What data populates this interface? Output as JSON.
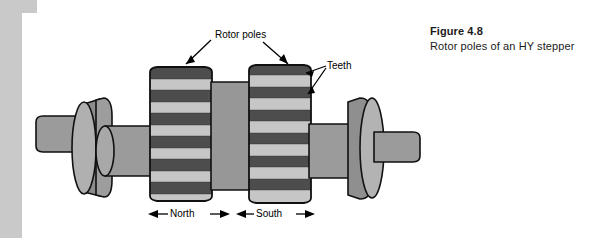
{
  "figure": {
    "caption_title": "Figure 4.8",
    "caption_body": "Rotor poles of an HY stepper"
  },
  "labels": {
    "rotor_poles": "Rotor poles",
    "teeth": "Teeth",
    "north": "North",
    "south": "South"
  },
  "diagram": {
    "type": "technical-illustration",
    "components": [
      "shaft",
      "bearing-disc-left",
      "rotor-pole-north",
      "center-hub",
      "rotor-pole-south",
      "bearing-disc-right"
    ],
    "tooth_count_north": 11,
    "tooth_count_south": 11,
    "tooth_phase_offset": "half-pitch"
  },
  "colors": {
    "page_edge": "#c9c9c9",
    "panel_background": "#ffffff",
    "tooth_dark": "#4d4d4d",
    "tooth_light": "#c6c6c6",
    "shaft_gray": "#9b9b9b",
    "disc_light": "#b3b3b3",
    "disc_dark": "#8c8c8c",
    "outline": "#111111",
    "text": "#1b1b1b"
  }
}
